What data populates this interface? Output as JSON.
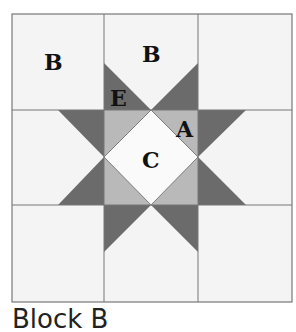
{
  "block": {
    "labels": {
      "B1": "B",
      "B2": "B",
      "E": "E",
      "A": "A",
      "C": "C"
    },
    "caption": "Block B",
    "colors": {
      "background": "#f4f4f4",
      "grid_line": "#777777",
      "dark_point": "#6b6b6b",
      "light_triangle": "#b9b9b9",
      "center": "#fafafa"
    }
  }
}
